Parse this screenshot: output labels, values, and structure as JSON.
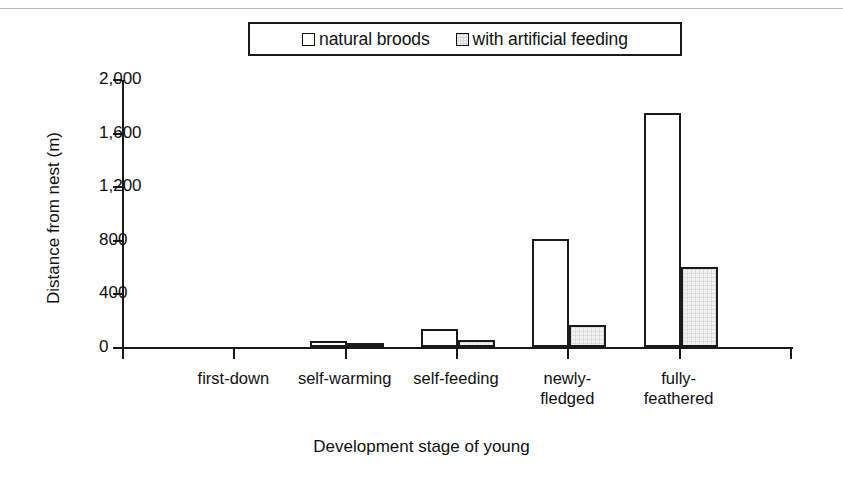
{
  "chart_data": {
    "type": "bar",
    "title": "",
    "xlabel": "Development stage of young",
    "ylabel": "Distance from nest (m)",
    "categories": [
      "first-down",
      "self-warming",
      "self-feeding",
      "newly-fledged",
      "fully-feathered"
    ],
    "category_lines": [
      [
        "first-down"
      ],
      [
        "self-warming"
      ],
      [
        "self-feeding"
      ],
      [
        "newly-",
        "fledged"
      ],
      [
        "fully-",
        "feathered"
      ]
    ],
    "series": [
      {
        "name": "natural broods",
        "values": [
          0,
          45,
          135,
          805,
          1745
        ],
        "swatch": "white"
      },
      {
        "name": "with artificial feeding",
        "values": [
          0,
          12,
          52,
          165,
          597
        ],
        "swatch": "hatched"
      }
    ],
    "ylim": [
      0,
      2000
    ],
    "yticks": [
      0,
      400,
      800,
      1200,
      1600,
      2000
    ],
    "ytick_labels": [
      "0",
      "400",
      "800",
      "1,200",
      "1,600",
      "2,000"
    ],
    "grid": false,
    "legend_position": "top-center"
  },
  "legend": {
    "entries": [
      {
        "label": "natural broods",
        "swatch_name": "legend-swatch-natural-broods"
      },
      {
        "label": "with artificial feeding",
        "swatch_name": "legend-swatch-artificial-feeding"
      }
    ]
  },
  "axes": {
    "y_title": "Distance from nest (m)",
    "x_title": "Development stage of young"
  },
  "colors": {
    "line": "#1a1a1a",
    "text": "#111111",
    "natural_fill": "#ffffff",
    "artificial_fill": "#f2f2f2",
    "background": "#ffffff",
    "top_rule": "#b9b9b9"
  }
}
